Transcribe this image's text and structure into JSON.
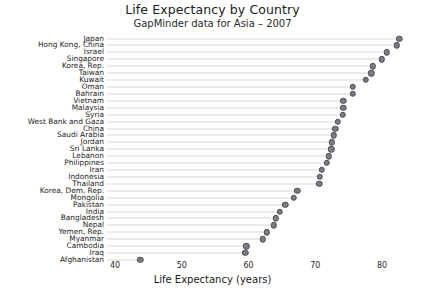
{
  "chart_data": {
    "type": "scatter",
    "title": "Life Expectancy by Country",
    "subtitle": "GapMinder data for Asia – 2007",
    "xlabel": "Life Expectancy (years)",
    "ylabel": "",
    "xlim": [
      40,
      85
    ],
    "xticks": [
      40,
      50,
      60,
      70,
      80
    ],
    "xtick_labels": [
      "40",
      "50",
      "60",
      "70",
      "80"
    ],
    "grid": "horizontal-dotted-leader-lines",
    "legend": "none",
    "sort": "descending",
    "categories": [
      "Japan",
      "Hong Kong, China",
      "Israel",
      "Singapore",
      "Korea, Rep.",
      "Taiwan",
      "Kuwait",
      "Oman",
      "Bahrain",
      "Vietnam",
      "Malaysia",
      "Syria",
      "West Bank and Gaza",
      "China",
      "Saudi Arabia",
      "Jordan",
      "Sri Lanka",
      "Lebanon",
      "Philippines",
      "Iran",
      "Indonesia",
      "Thailand",
      "Korea, Dem. Rep.",
      "Mongolia",
      "Pakistan",
      "India",
      "Bangladesh",
      "Nepal",
      "Yemen, Rep.",
      "Myanmar",
      "Cambodia",
      "Iraq",
      "Afghanistan"
    ],
    "values": [
      82.6,
      82.2,
      80.7,
      80.0,
      78.6,
      78.4,
      77.6,
      75.6,
      75.6,
      74.2,
      74.2,
      74.1,
      73.4,
      73.0,
      72.8,
      72.5,
      72.4,
      71.99,
      71.7,
      71.0,
      70.7,
      70.6,
      67.3,
      66.8,
      65.5,
      64.7,
      64.1,
      63.8,
      62.7,
      62.1,
      59.7,
      59.5,
      43.8
    ],
    "marker": {
      "shape": "circle",
      "fill": "#7c7c86",
      "edge": "#4a4a52"
    },
    "line_color": "#d9d9d9"
  }
}
